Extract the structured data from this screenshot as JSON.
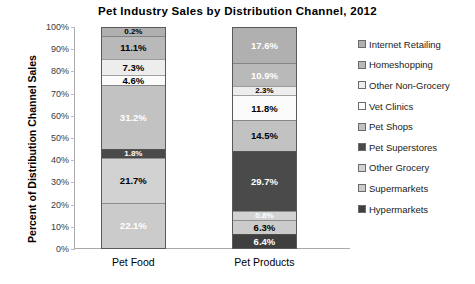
{
  "chart_data": {
    "type": "bar",
    "subtype": "stacked-100-percent",
    "title": "Pet Industry Sales by Distribution Channel, 2012",
    "xlabel": "",
    "ylabel": "Percent of Distribution Channel Sales",
    "categories": [
      "Pet Food",
      "Pet Products"
    ],
    "ylim": [
      0,
      100
    ],
    "ytick_labels": [
      "100%",
      "90%",
      "80%",
      "70%",
      "60%",
      "50%",
      "40%",
      "30%",
      "20%",
      "10%",
      "0%"
    ],
    "ytick_values": [
      100,
      90,
      80,
      70,
      60,
      50,
      40,
      30,
      20,
      10,
      0
    ],
    "grid": false,
    "legend_position": "right",
    "stack_order": "top-to-bottom",
    "series": [
      {
        "name": "Internet Retailing",
        "color": "#b0b0b0",
        "values": [
          0.2,
          17.6
        ],
        "labels": [
          "0.2%",
          "17.6%"
        ],
        "label_colors": [
          "#000000",
          "#ffffff"
        ]
      },
      {
        "name": "Homeshopping",
        "color": "#b9b9b9",
        "values": [
          11.1,
          10.9
        ],
        "labels": [
          "11.1%",
          "10.9%"
        ],
        "label_colors": [
          "#000000",
          "#ffffff"
        ]
      },
      {
        "name": "Other Non-Grocery",
        "color": "#ededed",
        "values": [
          7.3,
          2.3
        ],
        "labels": [
          "7.3%",
          "2.3%"
        ],
        "label_colors": [
          "#000000",
          "#000000"
        ]
      },
      {
        "name": "Vet Clinics",
        "color": "#fbfbfb",
        "values": [
          4.6,
          11.8
        ],
        "labels": [
          "4.6%",
          "11.8%"
        ],
        "label_colors": [
          "#000000",
          "#000000"
        ]
      },
      {
        "name": "Pet Shops",
        "color": "#c2c2c2",
        "values": [
          31.2,
          14.5
        ],
        "labels": [
          "31.2%",
          "14.5%"
        ],
        "label_colors": [
          "#ffffff",
          "#000000"
        ]
      },
      {
        "name": "Pet Superstores",
        "color": "#4a4a4a",
        "values": [
          1.8,
          29.7
        ],
        "labels": [
          "1.8%",
          "29.7%"
        ],
        "label_colors": [
          "#ffffff",
          "#ffffff"
        ]
      },
      {
        "name": "Other Grocery",
        "color": "#d2d2d2",
        "values": [
          21.7,
          0.8
        ],
        "labels": [
          "21.7%",
          "0.8%"
        ],
        "label_colors": [
          "#000000",
          "#ffffff"
        ]
      },
      {
        "name": "Supermarkets",
        "color": "#cbcbcb",
        "values": [
          22.1,
          6.3
        ],
        "labels": [
          "22.1%",
          "6.3%"
        ],
        "label_colors": [
          "#ffffff",
          "#000000"
        ]
      },
      {
        "name": "Hypermarkets",
        "color": "#3f3f3f",
        "values": [
          0.0,
          6.4
        ],
        "labels": [
          "",
          "6.4%"
        ],
        "label_colors": [
          "#ffffff",
          "#ffffff"
        ]
      }
    ]
  }
}
